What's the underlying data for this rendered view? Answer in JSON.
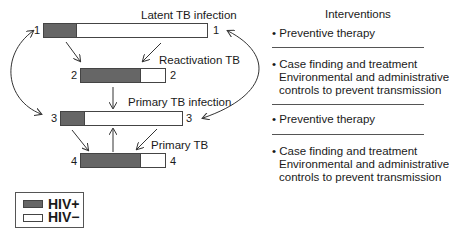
{
  "diagram": {
    "stages": [
      {
        "id": 1,
        "label": "Latent TB infection",
        "left_num": "1",
        "right_num": "1",
        "hiv_pos_fraction": 0.2
      },
      {
        "id": 2,
        "label": "Reactivation TB",
        "left_num": "2",
        "right_num": "2",
        "hiv_pos_fraction": 0.69
      },
      {
        "id": 3,
        "label": "Primary TB infection",
        "left_num": "3",
        "right_num": "3",
        "hiv_pos_fraction": 0.19
      },
      {
        "id": 4,
        "label": "Primary TB",
        "left_num": "4",
        "right_num": "4",
        "hiv_pos_fraction": 0.69
      }
    ],
    "interventions": {
      "title": "Interventions",
      "items": [
        {
          "bullet": "•",
          "lines": [
            "Preventive therapy"
          ]
        },
        {
          "bullet": "•",
          "lines": [
            "Case finding and treatment",
            "Environmental and administrative",
            "controls to prevent transmission"
          ]
        },
        {
          "bullet": "•",
          "lines": [
            "Preventive therapy"
          ]
        },
        {
          "bullet": "•",
          "lines": [
            "Case finding and treatment",
            "Environmental and administrative",
            "controls to prevent transmission"
          ]
        }
      ]
    },
    "legend": [
      {
        "label": "HIV+",
        "color": "#666666"
      },
      {
        "label": "HIV−",
        "color": "#ffffff"
      }
    ]
  }
}
